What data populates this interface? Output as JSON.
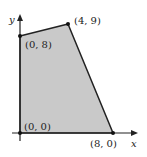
{
  "diagram": {
    "axes": {
      "x_label": "x",
      "y_label": "y"
    },
    "region_fill": "#c9c9c9",
    "edge_color": "#222222",
    "vertices": [
      {
        "label": "(0, 0)",
        "x": 0,
        "y": 0
      },
      {
        "label": "(0, 8)",
        "x": 0,
        "y": 8
      },
      {
        "label": "(4, 9)",
        "x": 4,
        "y": 9
      },
      {
        "label": "(8, 0)",
        "x": 8,
        "y": 0
      }
    ]
  }
}
